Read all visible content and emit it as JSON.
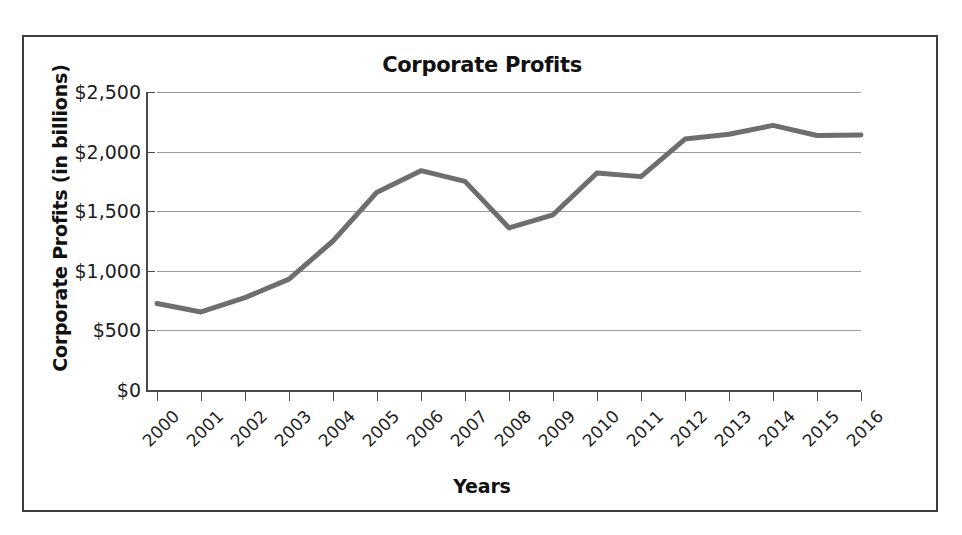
{
  "chart_data": {
    "type": "line",
    "title": "Corporate Profits",
    "xlabel": "Years",
    "ylabel": "Corporate Profits (in billions)",
    "x": [
      "2000",
      "2001",
      "2002",
      "2003",
      "2004",
      "2005",
      "2006",
      "2007",
      "2008",
      "2009",
      "2010",
      "2011",
      "2012",
      "2013",
      "2014",
      "2015",
      "2016"
    ],
    "values": [
      725,
      655,
      775,
      930,
      1250,
      1660,
      1840,
      1750,
      1360,
      1470,
      1820,
      1790,
      2105,
      2145,
      2220,
      2135,
      2140
    ],
    "categories": [
      "2000",
      "2001",
      "2002",
      "2003",
      "2004",
      "2005",
      "2006",
      "2007",
      "2008",
      "2009",
      "2010",
      "2011",
      "2012",
      "2013",
      "2014",
      "2015",
      "2016"
    ],
    "ylim": [
      0,
      2500
    ],
    "y_ticks": [
      0,
      500,
      1000,
      1500,
      2000,
      2500
    ],
    "y_tick_labels": [
      "$0",
      "$500",
      "$1,000",
      "$1,500",
      "$2,000",
      "$2,500"
    ],
    "grid": true,
    "legend": "none",
    "series": [
      {
        "name": "Corporate Profits",
        "color": "#6e6e6e",
        "values": [
          725,
          655,
          775,
          930,
          1250,
          1660,
          1840,
          1750,
          1360,
          1470,
          1820,
          1790,
          2105,
          2145,
          2220,
          2135,
          2140
        ]
      }
    ],
    "colors": {
      "line": "#6e6e6e",
      "grid": "#9a9a9a",
      "axis": "#4a4a4a",
      "text": "#1d1d1d",
      "border": "#3d3d3d",
      "background": "#ffffff"
    }
  }
}
